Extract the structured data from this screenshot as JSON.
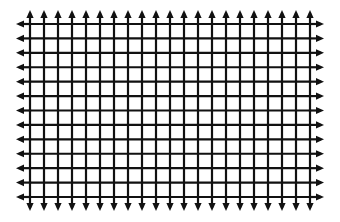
{
  "diagram": {
    "type": "grid-with-edge-arrows",
    "columns_lines": 21,
    "row_lines": 13,
    "grid_bounds": {
      "left": 30,
      "top": 24,
      "right": 310,
      "bottom": 197
    },
    "arrows": {
      "top": {
        "count": 21,
        "direction": "up"
      },
      "bottom": {
        "count": 21,
        "direction": "down"
      },
      "left": {
        "count": 13,
        "direction": "left"
      },
      "right": {
        "count": 13,
        "direction": "right"
      }
    },
    "colors": {
      "line": "#111111",
      "background": "#ffffff"
    },
    "line_width": 2.2,
    "arrow_length": 14
  }
}
